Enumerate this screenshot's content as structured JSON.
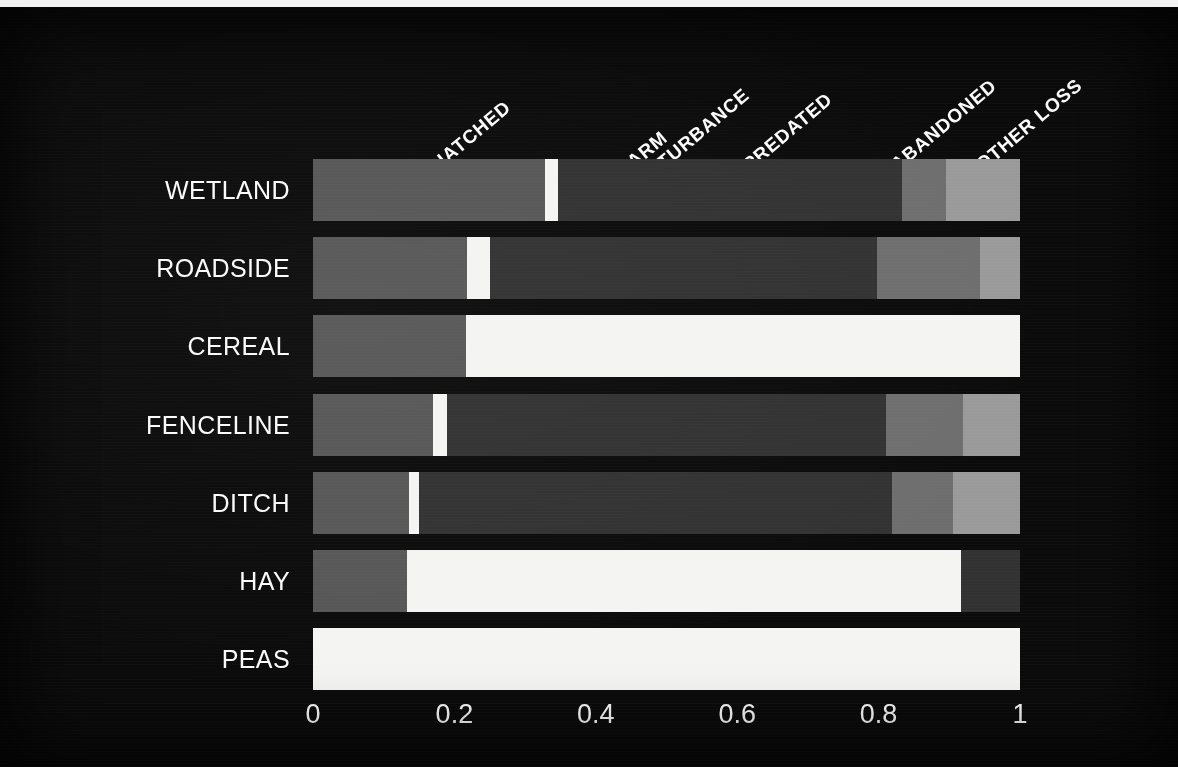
{
  "chart_data": {
    "type": "bar",
    "orientation": "horizontal",
    "stacked": true,
    "normalized": true,
    "title": "",
    "xlabel": "",
    "ylabel": "",
    "xlim": [
      0,
      1
    ],
    "grid": false,
    "legend_position": "top-rotated-headers",
    "xticks": [
      "0",
      "0.2",
      "0.4",
      "0.6",
      "0.8",
      "1"
    ],
    "xtick_values": [
      0,
      0.2,
      0.4,
      0.6,
      0.8,
      1
    ],
    "categories": [
      "WETLAND",
      "ROADSIDE",
      "CEREAL",
      "FENCELINE",
      "DITCH",
      "HAY",
      "PEAS"
    ],
    "series": [
      {
        "name": "HATCHED",
        "label": "HATCHED",
        "color": "#575757",
        "values": [
          0.328,
          0.218,
          0.216,
          0.17,
          0.136,
          0.133,
          0.0
        ]
      },
      {
        "name": "FARM DISTURBANCE",
        "label": "FARM\nDISTURBANCE",
        "color": "#f4f4f2",
        "values": [
          0.018,
          0.032,
          0.784,
          0.02,
          0.014,
          0.784,
          1.0
        ]
      },
      {
        "name": "PREDATED",
        "label": "PREDATED",
        "color": "#323232",
        "values": [
          0.487,
          0.548,
          0.0,
          0.62,
          0.669,
          0.083,
          0.0
        ]
      },
      {
        "name": "ABANDONED",
        "label": "ABANDONED",
        "color": "#6e6e6e",
        "values": [
          0.062,
          0.146,
          0.0,
          0.109,
          0.086,
          0.0,
          0.0
        ]
      },
      {
        "name": "OTHER LOSS",
        "label": "OTHER LOSS",
        "color": "#9a9a9a",
        "values": [
          0.105,
          0.056,
          0.0,
          0.081,
          0.095,
          0.0,
          0.0
        ]
      }
    ]
  },
  "axis": {
    "ticks": [
      {
        "label": "0",
        "value": 0
      },
      {
        "label": "0.2",
        "value": 0.2
      },
      {
        "label": "0.4",
        "value": 0.4
      },
      {
        "label": "0.6",
        "value": 0.6
      },
      {
        "label": "0.8",
        "value": 0.8
      },
      {
        "label": "1",
        "value": 1
      }
    ]
  },
  "headers": [
    {
      "name": "HATCHED",
      "text": "HATCHED",
      "x": 440,
      "y": 148
    },
    {
      "name": "FARM DISTURBANCE",
      "text": "FARM\nDISTURBANCE",
      "x": 640,
      "y": 148
    },
    {
      "name": "PREDATED",
      "text": "PREDATED",
      "x": 752,
      "y": 148
    },
    {
      "name": "ABANDONED",
      "text": "ABANDONED",
      "x": 900,
      "y": 148
    },
    {
      "name": "OTHER LOSS",
      "text": "OTHER LOSS",
      "x": 985,
      "y": 148
    }
  ],
  "rows": [
    {
      "label": "WETLAND",
      "top": 152,
      "height": 62
    },
    {
      "label": "ROADSIDE",
      "top": 230,
      "height": 62
    },
    {
      "label": "CEREAL",
      "top": 308,
      "height": 62
    },
    {
      "label": "FENCELINE",
      "top": 387,
      "height": 62
    },
    {
      "label": "DITCH",
      "top": 465,
      "height": 62
    },
    {
      "label": "HAY",
      "top": 543,
      "height": 62
    },
    {
      "label": "PEAS",
      "top": 621,
      "height": 62
    }
  ],
  "colors": {
    "background": "#0b0b0b",
    "text": "#fbfbfb",
    "hatched": "#575757",
    "farm_disturbance": "#f4f4f2",
    "predated": "#323232",
    "abandoned": "#6e6e6e",
    "other_loss": "#9a9a9a"
  }
}
